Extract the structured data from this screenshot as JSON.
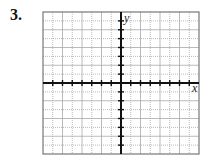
{
  "problem": {
    "number_label": "3."
  },
  "graph": {
    "x_label": "x",
    "y_label": "y",
    "grid": {
      "cells_x": 16,
      "cells_y": 16,
      "x_range": [
        -8,
        8
      ],
      "y_range": [
        -8,
        8
      ]
    },
    "colors": {
      "grid": "#9a9a9a",
      "axis": "#111111",
      "frame": "#777777"
    }
  }
}
